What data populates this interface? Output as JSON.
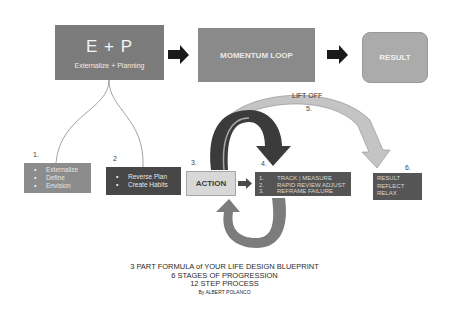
{
  "diagram": {
    "top_row": {
      "ep": {
        "title": "E + P",
        "subtitle": "Externalize + Planning",
        "color": "#7b7b7b"
      },
      "momentum": {
        "label": "MOMENTUM LOOP",
        "color": "#8a8a8a"
      },
      "result": {
        "label": "RESULT",
        "color": "#ababab"
      }
    },
    "steps": {
      "s1": {
        "number": "1.",
        "items": [
          "Externalize",
          "Define",
          "Envision"
        ],
        "color": "#8c8c8c"
      },
      "s2": {
        "number": "2",
        "items": [
          "Reverse Plan",
          "Create Habits"
        ],
        "color": "#474747"
      },
      "s3": {
        "number": "3.",
        "label": "ACTION",
        "color": "#d8d8d8"
      },
      "s4": {
        "number": "4.",
        "items": [
          {
            "num": "1.",
            "text": "TRACK | MEASURE"
          },
          {
            "num": "2.",
            "text": "RAPID REVIEW ADJUST"
          },
          {
            "num": "3.",
            "text": "REFRAME FAILURE"
          }
        ],
        "color": "#545454"
      },
      "s5": {
        "number": "5.",
        "label": "LIFT OFF"
      },
      "s6": {
        "number": "6.",
        "items": [
          "RESULT",
          "REFLECT",
          "RELAX"
        ],
        "color": "#555555"
      }
    },
    "footer": {
      "line1": "3 PART FORMULA of YOUR LIFE DESIGN BLUEPRINT",
      "line2": "6 STAGES OF PROGRESSION",
      "line3": "12 STEP PROCESS",
      "byline": "By ALBERT POLANCO"
    }
  }
}
